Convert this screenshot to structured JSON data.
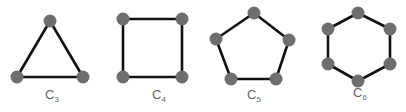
{
  "colors": {
    "background": "#ffffff",
    "edge": "#111111",
    "node": "#6e6e6e",
    "label": "#666666"
  },
  "style": {
    "node_radius": 6.5,
    "edge_width": 2.6
  },
  "graphs": [
    {
      "name": "C3",
      "label_main": "C",
      "label_sub": "3",
      "label_pos": [
        52,
        99
      ],
      "nodes": [
        [
          50,
          21
        ],
        [
          83,
          77
        ],
        [
          17,
          77
        ]
      ]
    },
    {
      "name": "C4",
      "label_main": "C",
      "label_sub": "4",
      "label_pos": [
        159,
        99
      ],
      "nodes": [
        [
          123,
          19
        ],
        [
          182,
          19
        ],
        [
          182,
          77
        ],
        [
          123,
          77
        ]
      ]
    },
    {
      "name": "C5",
      "label_main": "C",
      "label_sub": "5",
      "label_pos": [
        254,
        99
      ],
      "nodes": [
        [
          254,
          13
        ],
        [
          289,
          40
        ],
        [
          276,
          79
        ],
        [
          231,
          79
        ],
        [
          216,
          39
        ]
      ]
    },
    {
      "name": "C6",
      "label_main": "C",
      "label_sub": "6",
      "label_pos": [
        360,
        97
      ],
      "nodes": [
        [
          358,
          13
        ],
        [
          390,
          29
        ],
        [
          390,
          64
        ],
        [
          358,
          81
        ],
        [
          328,
          64
        ],
        [
          328,
          29
        ]
      ]
    }
  ]
}
